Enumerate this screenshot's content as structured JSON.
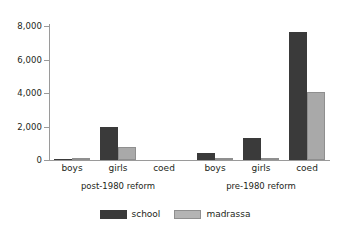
{
  "chart_data": {
    "type": "bar",
    "title": "",
    "subtitle": "",
    "xlabel": "",
    "ylabel": "",
    "ylim": [
      0,
      8000
    ],
    "ytick_labels": [
      "0",
      "2,000",
      "4,000",
      "6,000",
      "8,000"
    ],
    "ytick_values": [
      0,
      2000,
      4000,
      6000,
      8000
    ],
    "grid": false,
    "legend_position": "bottom-center",
    "legend": [
      "school",
      "madrassa"
    ],
    "groups": [
      {
        "label": "post-1980 reform",
        "categories": [
          "boys",
          "girls",
          "coed"
        ]
      },
      {
        "label": "pre-1980 reform",
        "categories": [
          "boys",
          "girls",
          "coed"
        ]
      }
    ],
    "categories": [
      "post-1980 reform / boys",
      "post-1980 reform / girls",
      "post-1980 reform / coed",
      "pre-1980 reform / boys",
      "pre-1980 reform / girls",
      "pre-1980 reform / coed"
    ],
    "series": [
      {
        "name": "school",
        "color": "#3a3a3a",
        "values": [
          80,
          2000,
          0,
          420,
          1320,
          7640
        ]
      },
      {
        "name": "madrassa",
        "color": "#a9a9a9",
        "values": [
          60,
          800,
          0,
          130,
          90,
          4060
        ]
      }
    ]
  },
  "axis": {
    "ticks": [
      {
        "label": "8,000",
        "value": 8000
      },
      {
        "label": "6,000",
        "value": 6000
      },
      {
        "label": "4,000",
        "value": 4000
      },
      {
        "label": "2,000",
        "value": 2000
      },
      {
        "label": "0",
        "value": 0
      }
    ]
  },
  "x_labels": [
    {
      "text": "boys",
      "center": 72
    },
    {
      "text": "girls",
      "center": 118
    },
    {
      "text": "coed",
      "center": 164
    },
    {
      "text": "boys",
      "center": 215
    },
    {
      "text": "girls",
      "center": 261
    },
    {
      "text": "coed",
      "center": 307
    }
  ],
  "group_labels": [
    {
      "text": "post-1980 reform",
      "center": 118
    },
    {
      "text": "pre-1980 reform",
      "center": 261
    }
  ],
  "legend_items": [
    {
      "label": "school",
      "swatch": "school-swatch"
    },
    {
      "label": "madrassa",
      "swatch": "madrassa-swatch"
    }
  ],
  "colors": {
    "school": "#3a3a3a",
    "madrassa": "#a9a9a9",
    "axis": "#9a9a9a",
    "text": "#231f20",
    "background": "#ffffff"
  }
}
